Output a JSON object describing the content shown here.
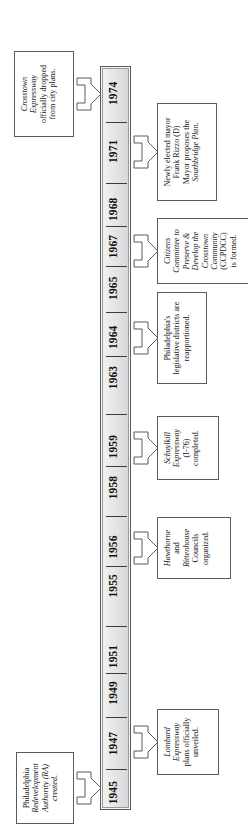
{
  "figure": {
    "kind": "timeline",
    "orientation": "vertical-rotated",
    "title": ""
  },
  "timeline": {
    "axis_label": "",
    "years": [
      {
        "label": "1945",
        "pos": 0.022
      },
      {
        "label": "1947",
        "pos": 0.088
      },
      {
        "label": "1949",
        "pos": 0.156
      },
      {
        "label": "1951",
        "pos": 0.205
      },
      {
        "label": "1955",
        "pos": 0.3
      },
      {
        "label": "1956",
        "pos": 0.352
      },
      {
        "label": "1958",
        "pos": 0.432
      },
      {
        "label": "1959",
        "pos": 0.487
      },
      {
        "label": "1963",
        "pos": 0.58
      },
      {
        "label": "1964",
        "pos": 0.634
      },
      {
        "label": "1965",
        "pos": 0.7
      },
      {
        "label": "1967",
        "pos": 0.756
      },
      {
        "label": "1968",
        "pos": 0.806
      },
      {
        "label": "1971",
        "pos": 0.884
      },
      {
        "label": "1974",
        "pos": 0.962
      }
    ],
    "ticks": [
      0.052,
      0.122,
      0.182,
      0.245,
      0.325,
      0.392,
      0.46,
      0.53,
      0.607,
      0.666,
      0.728,
      0.782,
      0.84,
      0.922
    ]
  },
  "events": [
    {
      "id": "ra-created",
      "year": "1945",
      "side": "above",
      "lines": [
        {
          "text": "Philadelphia",
          "italic": false
        },
        {
          "text": "Redevelopment",
          "italic": true
        },
        {
          "text": "Authority (RA) created.",
          "italic": true
        }
      ]
    },
    {
      "id": "lombard-expressway",
      "year": "1947",
      "side": "below",
      "lines": [
        {
          "text": "Lombard",
          "italic": true
        },
        {
          "text": "Expressway",
          "italic": true
        },
        {
          "text": "plans officially",
          "italic": false
        },
        {
          "text": "unveiled.",
          "italic": false
        }
      ]
    },
    {
      "id": "hawthorne-rittenhouse-councils",
      "year": "1956",
      "side": "below",
      "lines": [
        {
          "text": "Hawthorne",
          "italic": true
        },
        {
          "text": "and",
          "italic": false
        },
        {
          "text": "Rittenhouse",
          "italic": true
        },
        {
          "text": "Councils",
          "italic": false
        },
        {
          "text": "organized.",
          "italic": false
        }
      ]
    },
    {
      "id": "schuylkill-expressway",
      "year": "1959",
      "side": "below",
      "lines": [
        {
          "text": "Schuylkill",
          "italic": true
        },
        {
          "text": "Expressway",
          "italic": true
        },
        {
          "text": "(I-76)",
          "italic": false
        },
        {
          "text": "completed.",
          "italic": false
        }
      ]
    },
    {
      "id": "districts-reapportioned",
      "year": "1964",
      "side": "below",
      "lines": [
        {
          "text": "Philadelphia's",
          "italic": false
        },
        {
          "text": "legislative districts are",
          "italic": false
        },
        {
          "text": "reapportioned.",
          "italic": false
        }
      ]
    },
    {
      "id": "ccpdcc-formed",
      "year": "1967",
      "side": "below",
      "lines": [
        {
          "text": "Citizens",
          "italic": true
        },
        {
          "text": "Committee to",
          "italic": true
        },
        {
          "text": "Preserve &",
          "italic": true
        },
        {
          "text": "Develop the",
          "italic": true
        },
        {
          "text": "Crosstown",
          "italic": true
        },
        {
          "text": "Community",
          "italic": true
        },
        {
          "text": "(CCPDCC)",
          "italic": false
        },
        {
          "text": "is formed.",
          "italic": false
        }
      ]
    },
    {
      "id": "rizzo-southbridge",
      "year": "1971",
      "side": "below",
      "lines": [
        {
          "text": "Newly elected mayor",
          "italic": false
        },
        {
          "text": "Frank Rizzo (D)",
          "italic": false
        },
        {
          "text": "Mayor  proposes the",
          "italic": false
        },
        {
          "text": "Southbridge Plan.",
          "italic": true
        }
      ]
    },
    {
      "id": "crosstown-dropped",
      "year": "1974",
      "side": "above",
      "lines": [
        {
          "text": "Crosstown",
          "italic": true
        },
        {
          "text": "Expressway",
          "italic": true
        },
        {
          "text": "officially dropped",
          "italic": false
        },
        {
          "text": "from city plans.",
          "italic": false
        }
      ]
    }
  ],
  "style": {
    "bar_fill": "#e5e5e5",
    "bar_stroke": "#5a5a5a",
    "box_stroke": "#5b5b5b",
    "text_color": "#161616",
    "page_bg": "#ffffff"
  }
}
